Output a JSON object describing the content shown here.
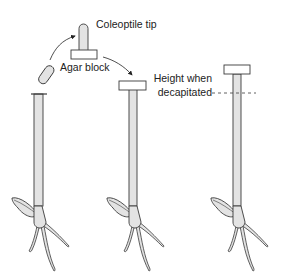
{
  "figure": {
    "labels": {
      "coleoptile_tip": "Coleoptile tip",
      "agar_block": "Agar block",
      "height_line_1": "Height when",
      "height_line_2": "decapitated"
    },
    "colors": {
      "fill": "#e3e3e3",
      "stroke": "#3a3a3a",
      "text": "#222222"
    },
    "stages": [
      {
        "name": "decapitated-with-tip-on-agar"
      },
      {
        "name": "agar-block-on-stump"
      },
      {
        "name": "grown-seedling"
      }
    ]
  }
}
